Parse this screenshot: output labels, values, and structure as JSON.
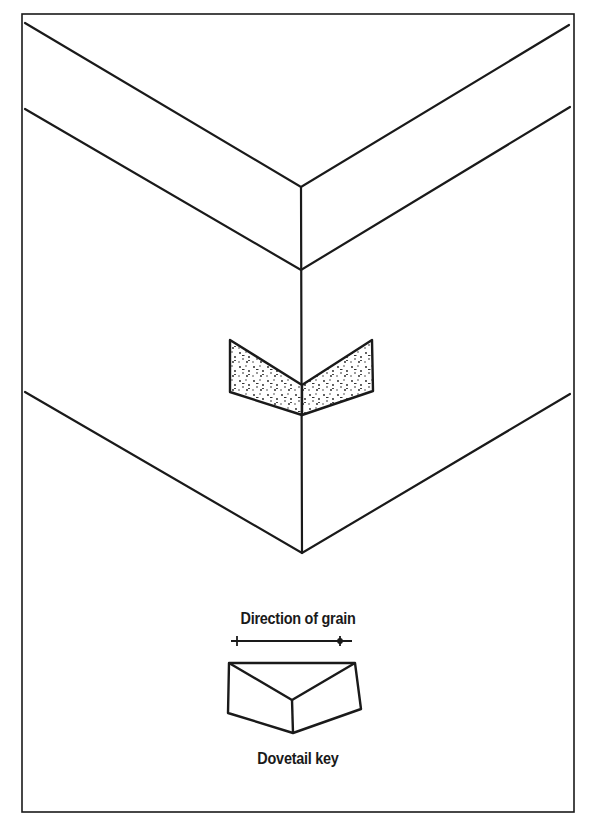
{
  "figure": {
    "type": "technical-illustration",
    "line_color": "#1a1a1a",
    "background": "#ffffff",
    "fill_pattern": "stippled"
  },
  "labels": {
    "grain_direction": "Direction of grain",
    "key_name": "Dovetail key"
  },
  "icons": {
    "grain_arrow": "double-ended-arrow-icon",
    "key_inset": "stippled-dovetail-key",
    "key_detail": "dovetail-key-shape"
  }
}
